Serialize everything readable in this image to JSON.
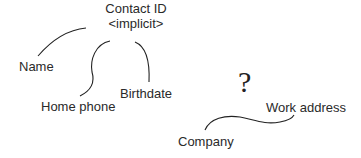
{
  "diagram": {
    "root": {
      "line1": "Contact ID",
      "line2": "<implicit>"
    },
    "attributes": [
      {
        "label": "Name"
      },
      {
        "label": "Home phone"
      },
      {
        "label": "Birthdate"
      }
    ],
    "unknown_group": {
      "symbol": "?",
      "labels": [
        {
          "label": "Work address"
        },
        {
          "label": "Company"
        }
      ]
    },
    "colors": {
      "line": "#222222",
      "text": "#2a2a2a",
      "background": "#ffffff"
    }
  }
}
